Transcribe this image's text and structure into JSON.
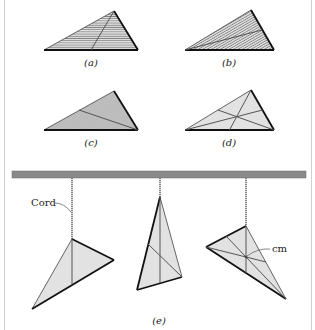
{
  "figure": {
    "panels": [
      {
        "id": "a",
        "label": "(a)",
        "hatch": "horizontal",
        "line": "median from apex to base midpoint"
      },
      {
        "id": "b",
        "label": "(b)",
        "hatch": "diagonal",
        "line": "median from left vertex to midpoint of right side"
      },
      {
        "id": "c",
        "label": "(c)",
        "hatch": "diagonal-dense",
        "line": "median from right vertex to midpoint of left side"
      },
      {
        "id": "d",
        "label": "(d)",
        "hatch": "none",
        "line": "all three medians intersecting"
      }
    ],
    "hanging_panel": {
      "label": "(e)",
      "cord_label": "Cord",
      "cm_label": "cm"
    },
    "colors": {
      "fill_light": "#e2e2e2",
      "hatch": "#7a7a7a",
      "edge_dark": "#111111",
      "median": "#555555",
      "bar": "#8a8a8a",
      "border": "#cfcfcf"
    }
  }
}
